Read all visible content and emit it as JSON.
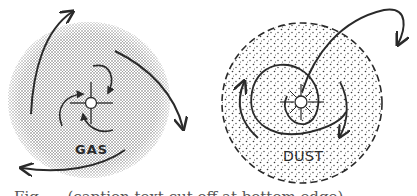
{
  "figure": {
    "panels": [
      {
        "id": "gas",
        "label": "GAS",
        "disk_style": "dense stipple",
        "disk_color": "#8a8a8a",
        "center": [
          88,
          100
        ],
        "radius": 80,
        "star": "open circle with four spokes",
        "arrows": [
          "outward curving arrows (top-left, right, bottom-left)",
          "inward spiraling arrows near star"
        ]
      },
      {
        "id": "dust",
        "label": "DUST",
        "disk_style": "sparse stipple, dashed boundary",
        "disk_color": "#333333",
        "center": [
          300,
          103
        ],
        "radius": 80,
        "star": "open circle with radiating spokes",
        "arrows": [
          "large spiral orbit",
          "outward arc exiting top-right"
        ]
      }
    ],
    "caption_fragment": "Fig. ... (caption text cut off at bottom edge)"
  },
  "colors": {
    "ink": "#2a2a2a",
    "background": "#ffffff",
    "gas_stipple": "#6f6f6f",
    "dust_stipple": "#3a3a3a"
  }
}
